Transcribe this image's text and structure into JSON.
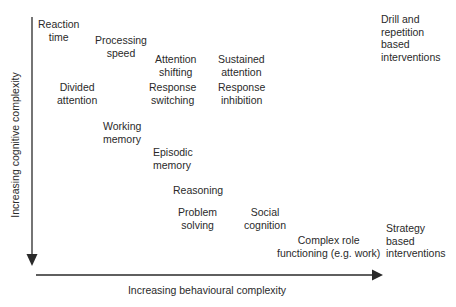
{
  "diagram": {
    "y_axis_label": "Increasing cognitive complexity",
    "x_axis_label": "Increasing behavioural complexity",
    "top_right_label": "Drill and\nrepetition\nbased\ninterventions",
    "bottom_right_label": "Strategy\nbased\ninterventions",
    "nodes": [
      {
        "label": "Reaction\ntime"
      },
      {
        "label": "Processing\nspeed"
      },
      {
        "label": "Attention\nshifting"
      },
      {
        "label": "Sustained\nattention"
      },
      {
        "label": "Divided\nattention"
      },
      {
        "label": "Response\nswitching"
      },
      {
        "label": "Response\ninhibition"
      },
      {
        "label": "Working\nmemory"
      },
      {
        "label": "Episodic\nmemory"
      },
      {
        "label": "Reasoning"
      },
      {
        "label": "Problem\nsolving"
      },
      {
        "label": "Social\ncognition"
      },
      {
        "label": "Complex role\nfunctioning (e.g. work)"
      }
    ],
    "colors": {
      "axis": "#2a2a2a",
      "text": "#2a2a2a",
      "background": "#ffffff"
    }
  }
}
